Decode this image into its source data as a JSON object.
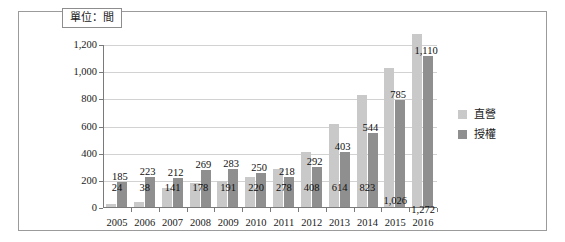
{
  "figure": {
    "unit_caption": "單位：間",
    "background_color": "#ffffff",
    "frame_border_color": "#9b9b9b"
  },
  "legend": {
    "position": "right",
    "items": [
      {
        "label": "直營",
        "color": "#c9c9c9"
      },
      {
        "label": "授權",
        "color": "#8f8f8f"
      }
    ]
  },
  "chart_data": {
    "type": "bar",
    "title": "",
    "subtitle": "",
    "xlabel": "",
    "ylabel": "",
    "unit_note": "單位：間",
    "categories": [
      "2005",
      "2006",
      "2007",
      "2008",
      "2009",
      "2010",
      "2011",
      "2012",
      "2013",
      "2014",
      "2015",
      "2016"
    ],
    "series": [
      {
        "name": "直營",
        "color": "#c9c9c9",
        "values": [
          24,
          38,
          141,
          178,
          191,
          220,
          278,
          408,
          614,
          823,
          1026,
          1272
        ],
        "labels": [
          "24",
          "38",
          "141",
          "178",
          "191",
          "220",
          "278",
          "408",
          "614",
          "823",
          "1,026",
          "1,272"
        ]
      },
      {
        "name": "授權",
        "color": "#8f8f8f",
        "values": [
          185,
          223,
          212,
          269,
          283,
          250,
          218,
          292,
          403,
          544,
          785,
          1110
        ],
        "labels": [
          "185",
          "223",
          "212",
          "269",
          "283",
          "250",
          "218",
          "292",
          "403",
          "544",
          "785",
          "1,110"
        ]
      }
    ],
    "ylim": [
      0,
      1200
    ],
    "yticks": [
      0,
      200,
      400,
      600,
      800,
      1000,
      1200
    ],
    "ytick_labels": [
      "0",
      "200",
      "400",
      "600",
      "800",
      "1,000",
      "1,200"
    ],
    "grid": true,
    "legend_position": "right"
  }
}
